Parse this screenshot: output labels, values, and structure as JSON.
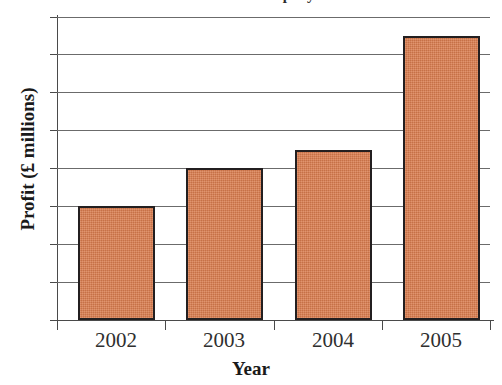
{
  "chart_data": {
    "type": "bar",
    "title": "Profit of a company",
    "xlabel": "Year",
    "ylabel": "Profit (£ millions)",
    "categories": [
      "2002",
      "2003",
      "2004",
      "2005"
    ],
    "values": [
      3.0,
      4.0,
      4.5,
      7.5
    ],
    "series": [
      {
        "name": "Profit",
        "values": [
          3.0,
          4.0,
          4.5,
          7.5
        ]
      }
    ],
    "ylim": [
      0,
      8
    ],
    "y_tick_labels": [],
    "y_gridline_values": [
      1,
      2,
      3,
      4,
      5,
      6,
      7,
      8
    ],
    "grid": true,
    "legend": false,
    "bar_color": "#da7c4e",
    "bar_border_color": "#231f20",
    "gridline_color": "#6b6b6b",
    "axis_color": "#4a4a4a",
    "units": "£ millions"
  },
  "figure": {
    "title": "Profit of a company",
    "x_axis_title": "Year",
    "y_axis_title": "Profit (£ millions)",
    "x_tick_labels": [
      "2002",
      "2003",
      "2004",
      "2005"
    ]
  }
}
